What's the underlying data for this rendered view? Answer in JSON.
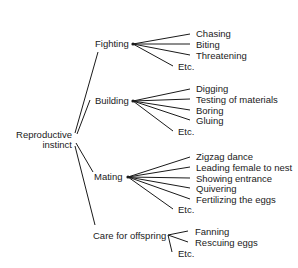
{
  "diagram": {
    "root": {
      "line1": "Reproductive",
      "line2": "instinct"
    },
    "branches": [
      {
        "label": "Fighting",
        "children": [
          "Chasing",
          "Biting",
          "Threatening",
          "Etc."
        ]
      },
      {
        "label": "Building",
        "children": [
          "Digging",
          "Testing of materials",
          "Boring",
          "Gluing",
          "Etc."
        ]
      },
      {
        "label": "Mating",
        "children": [
          "Zigzag dance",
          "Leading female to nest",
          "Showing entrance",
          "Quivering",
          "Fertilizing the eggs",
          "Etc."
        ]
      },
      {
        "label": "Care for offspring",
        "children": [
          "Fanning",
          "Rescuing eggs",
          "Etc."
        ]
      }
    ]
  }
}
